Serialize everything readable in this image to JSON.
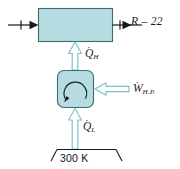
{
  "diagram": {
    "colors": {
      "component_fill": "#b5dde1",
      "component_stroke": "#5f9ea4",
      "flow_arrow_stroke": "#7fc3c9",
      "flow_arrow_fill": "#ffffff",
      "line_stroke": "#1a1a1a",
      "background": "#ffffff",
      "text": "#1a1a1a"
    },
    "condenser_box": {
      "name": "condenser",
      "label": ""
    },
    "heat_pump": {
      "name": "heat-pump-unit",
      "cycle_direction": "counterclockwise"
    },
    "labels": {
      "refrigerant": "R – 22",
      "q_high_symbol": "Q",
      "q_high_subscript": "H",
      "q_low_symbol": "Q",
      "q_low_subscript": "L",
      "work_symbol": "W",
      "work_subscript": "H.P.",
      "dot_accent": "˙",
      "reservoir_temperature": "300 K"
    },
    "flows": [
      {
        "name": "inlet-stream",
        "direction": "right",
        "style": "solid-line"
      },
      {
        "name": "outlet-stream",
        "direction": "right",
        "style": "solid-line"
      },
      {
        "name": "q-high-flow",
        "direction": "up",
        "style": "hollow-arrow"
      },
      {
        "name": "q-low-flow",
        "direction": "up",
        "style": "hollow-arrow"
      },
      {
        "name": "work-input-flow",
        "direction": "left",
        "style": "hollow-arrow"
      }
    ]
  }
}
